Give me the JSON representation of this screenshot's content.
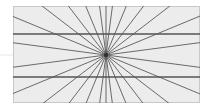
{
  "illusion": {
    "name": "Hering illusion",
    "canvas": {
      "width": 206,
      "height": 108,
      "page_bg": "#ffffff"
    },
    "panel": {
      "x": 13,
      "y": 6,
      "width": 187,
      "height": 97,
      "fill": "#ececec",
      "stroke": "#c8c8c8"
    },
    "center": {
      "x": 106,
      "y": 55
    },
    "rays": {
      "count": 24,
      "angle_step_deg": 15,
      "start_deg": 7.5,
      "color": "#5a5a5a",
      "width": 0.9
    },
    "extra_rays_deg": [
      90,
      270
    ],
    "horizontal_lines": [
      {
        "y": 34,
        "color": "#555555",
        "width": 1.6
      },
      {
        "y": 77,
        "color": "#555555",
        "width": 1.6
      }
    ],
    "faint_mid_line": {
      "y": 55,
      "x1": 0,
      "x2": 13,
      "color": "#e6e6e6"
    }
  }
}
